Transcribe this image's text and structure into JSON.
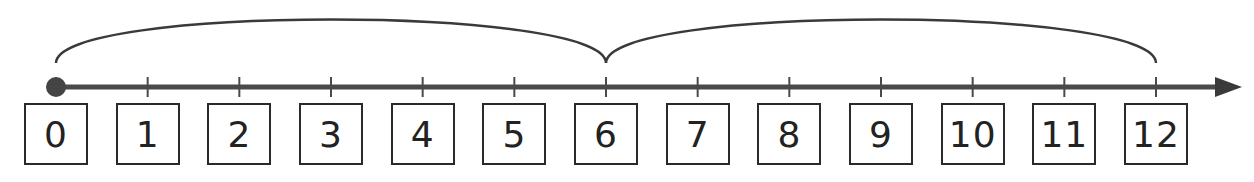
{
  "number_line": {
    "start": 0,
    "end": 12,
    "step": 1,
    "labels": [
      "0",
      "1",
      "2",
      "3",
      "4",
      "5",
      "6",
      "7",
      "8",
      "9",
      "10",
      "11",
      "12"
    ],
    "start_marker": "filled-dot",
    "end_marker": "arrow"
  },
  "jumps": [
    {
      "from": 0,
      "to": 6,
      "size": 6
    },
    {
      "from": 6,
      "to": 12,
      "size": 6
    }
  ],
  "colors": {
    "line": "#444444",
    "box_border": "#2a2a2a",
    "text": "#222222",
    "background": "#ffffff"
  }
}
